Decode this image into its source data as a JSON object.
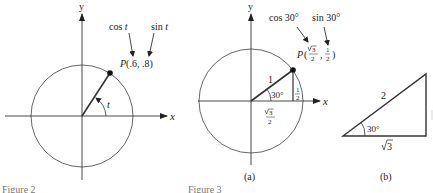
{
  "figure_left": {
    "axis_x_label": "x",
    "axis_y_label": "y",
    "cos_label": "cos t",
    "cos_word": "cos",
    "sin_word": "sin",
    "var": "t",
    "point_label": "P(.6, .8)",
    "point_name": "P",
    "point_coords": "(.6, .8)",
    "angle_label": "t",
    "caption": "Figure 2"
  },
  "figure_right": {
    "axis_x_label": "x",
    "axis_y_label": "y",
    "cos_label": "cos 30°",
    "sin_label": "sin 30°",
    "point_name": "P",
    "point_x_num": "3",
    "point_x_den": "2",
    "point_y_num": "1",
    "point_y_den": "2",
    "hypotenuse_label": "1",
    "angle_label": "30°",
    "opposite_num": "1",
    "opposite_den": "2",
    "adjacent_num": "3",
    "adjacent_den": "2",
    "subcaption_a": "(a)",
    "caption": "Figure 3"
  },
  "triangle_b": {
    "hypotenuse_label": "2",
    "angle_label": "30°",
    "base_label": "3",
    "subcaption_b": "(b)"
  }
}
